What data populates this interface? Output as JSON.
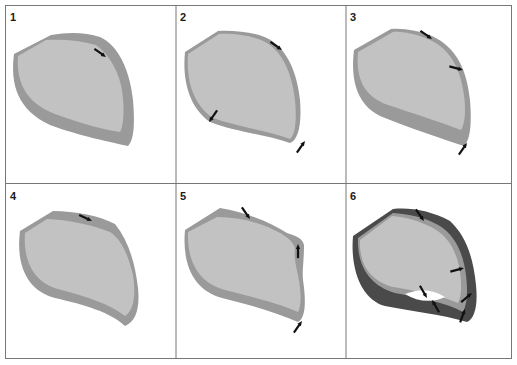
{
  "figure": {
    "panels": [
      {
        "label": "1",
        "arrows": 1,
        "description": "Outer wall uniform thickness, one arrow at upper right"
      },
      {
        "label": "2",
        "arrows": 3,
        "description": "Thin wall, arrows at upper right, lower left and lower right"
      },
      {
        "label": "3",
        "arrows": 3,
        "description": "Thin upper wall, thick lower wall, arrows along right side"
      },
      {
        "label": "4",
        "arrows": 1,
        "description": "Thick top wall, arrow at top"
      },
      {
        "label": "5",
        "arrows": 3,
        "description": "Bulge at right, arrows at top, right bulge and bottom right"
      },
      {
        "label": "6",
        "arrows": 6,
        "description": "Dark thick outer wall with gap at bottom, multiple arrows"
      }
    ],
    "colors": {
      "inner": "#c2c2c2",
      "wall": "#9a9a9a",
      "dark_wall": "#4a4a4a",
      "arrow": "#111111",
      "grid": "#777777"
    }
  }
}
